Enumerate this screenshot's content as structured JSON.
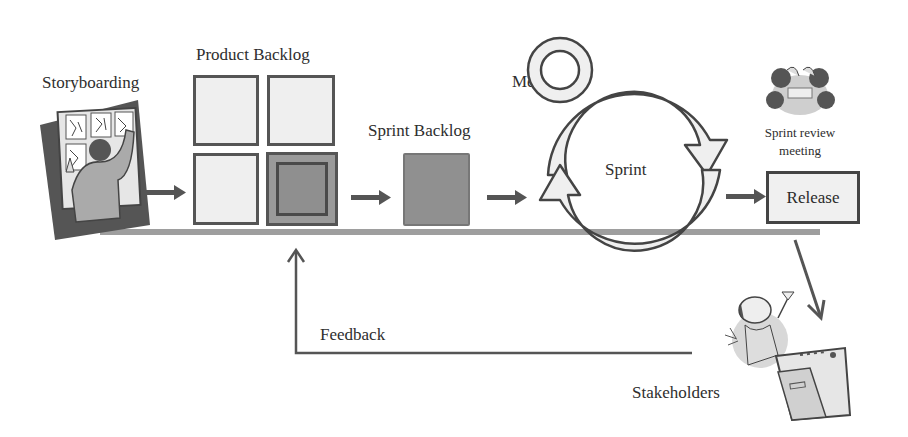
{
  "diagram": {
    "labels": {
      "storyboarding": "Storyboarding",
      "product_backlog": "Product Backlog",
      "sprint_backlog": "Sprint Backlog",
      "daily_meetings": "Daily Meetings",
      "daily_meetings_line1": "Daily",
      "daily_meetings_line2": "Meetings",
      "sprint": "Sprint",
      "sprint_review_line1": "Sprint review",
      "sprint_review_line2": "meeting",
      "release": "Release",
      "feedback": "Feedback",
      "stakeholders": "Stakeholders"
    },
    "product_backlog_items": [
      {
        "id": "pb-1",
        "state": "empty"
      },
      {
        "id": "pb-2",
        "state": "empty"
      },
      {
        "id": "pb-3",
        "state": "empty"
      },
      {
        "id": "pb-4",
        "state": "selected"
      }
    ],
    "flow": [
      "Storyboarding",
      "Product Backlog",
      "Sprint Backlog",
      "Sprint",
      "Release",
      "Stakeholders",
      "Feedback"
    ],
    "icons": {
      "storyboarding": "person-at-storyboard-icon",
      "sprint_review": "meeting-people-icon",
      "stakeholders": "celebrating-person-icon",
      "daily_meetings": "ring-icon",
      "sprint": "cycle-arrows-icon"
    },
    "colors": {
      "background": "#ffffff",
      "stroke": "#4a4a4a",
      "light_fill": "#efefef",
      "dark_fill": "#909090",
      "timeline": "#9e9e9e"
    }
  }
}
